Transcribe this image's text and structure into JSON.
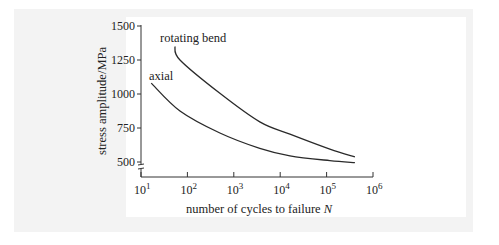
{
  "chart_data": {
    "type": "line",
    "title": "",
    "xlabel": "number of cycles to failure",
    "xlabel_var": "N",
    "ylabel": "stress amplitude/MPa",
    "xscale": "log",
    "xlim": [
      10,
      1000000
    ],
    "ylim": [
      500,
      1500
    ],
    "y_axis_break": true,
    "grid": false,
    "legend_position": "inline labels",
    "x_ticks": [
      {
        "base": "10",
        "exp": "1"
      },
      {
        "base": "10",
        "exp": "2"
      },
      {
        "base": "10",
        "exp": "3"
      },
      {
        "base": "10",
        "exp": "4"
      },
      {
        "base": "10",
        "exp": "5"
      },
      {
        "base": "10",
        "exp": "6"
      }
    ],
    "y_ticks": [
      "500",
      "750",
      "1000",
      "1250",
      "1500"
    ],
    "series": [
      {
        "name": "rotating bend",
        "points": [
          {
            "log10N": 1.73,
            "stress": 1350
          },
          {
            "log10N": 1.84,
            "stress": 1250
          },
          {
            "log10N": 2.7,
            "stress": 1005
          },
          {
            "log10N": 3.56,
            "stress": 795
          },
          {
            "log10N": 4.21,
            "stress": 705
          },
          {
            "log10N": 5.07,
            "stress": 595
          },
          {
            "log10N": 5.61,
            "stress": 537
          }
        ]
      },
      {
        "name": "axial",
        "points": [
          {
            "log10N": 1.22,
            "stress": 1080
          },
          {
            "log10N": 1.84,
            "stress": 875
          },
          {
            "log10N": 2.7,
            "stress": 713
          },
          {
            "log10N": 3.56,
            "stress": 600
          },
          {
            "log10N": 4.21,
            "stress": 545
          },
          {
            "log10N": 5.07,
            "stress": 510
          },
          {
            "log10N": 5.61,
            "stress": 495
          }
        ]
      }
    ]
  }
}
